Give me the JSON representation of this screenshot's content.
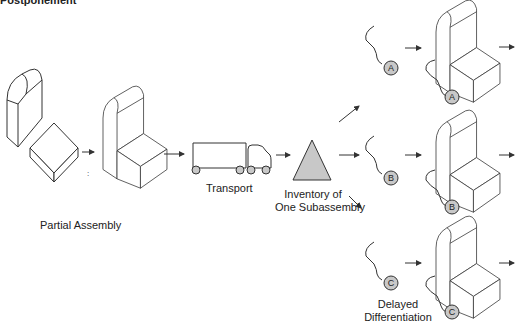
{
  "title": "Postponement",
  "labels": {
    "partial_assembly": "Partial Assembly",
    "transport": "Transport",
    "inventory_line1": "Inventory of",
    "inventory_line2": "One Subassembly",
    "delayed_line1": "Delayed",
    "delayed_line2": "Differentiation"
  },
  "variants": [
    {
      "id": "A"
    },
    {
      "id": "B"
    },
    {
      "id": "C"
    }
  ],
  "colors": {
    "line": "#333333",
    "fill_gray": "#c8c8c8",
    "background": "#ffffff"
  }
}
